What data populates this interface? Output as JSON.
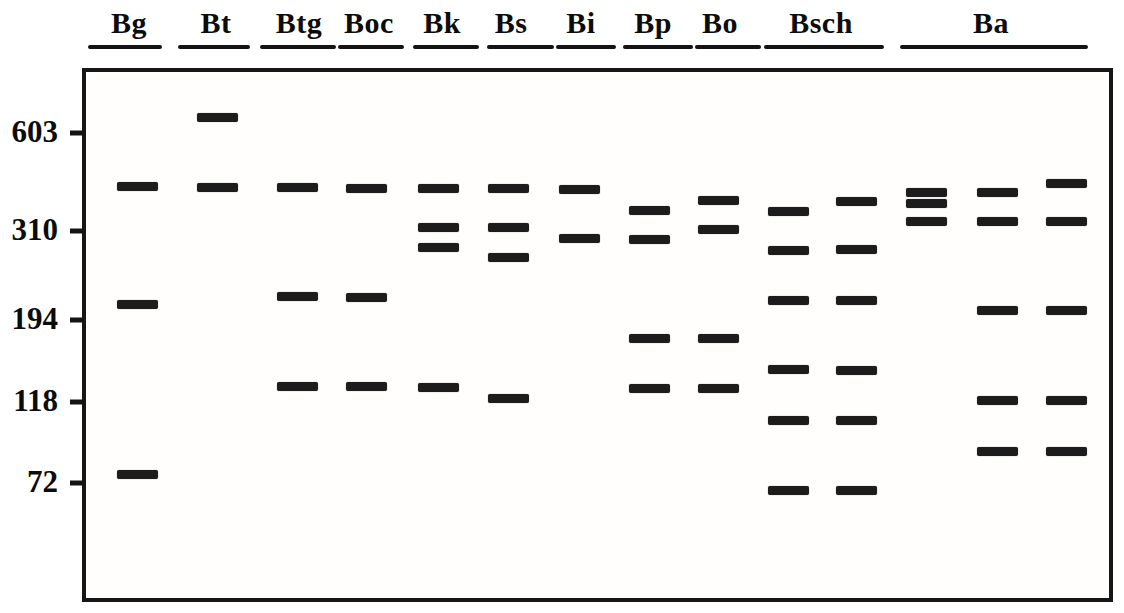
{
  "figure": {
    "kind": "gel-electrophoresis-schematic",
    "background_color": "#ffffff",
    "band_color": "#1c1c1c",
    "border_color": "#161616",
    "text_color": "#0c0c0c"
  },
  "gel": {
    "box": {
      "left": 82,
      "top": 68,
      "width": 1031,
      "height": 534
    },
    "band_size": {
      "width": 41,
      "height": 9
    },
    "markers": [
      {
        "label": "603",
        "y": 133
      },
      {
        "label": "310",
        "y": 231
      },
      {
        "label": "194",
        "y": 320
      },
      {
        "label": "118",
        "y": 402
      },
      {
        "label": "72",
        "y": 483
      }
    ],
    "lane_groups": [
      {
        "label": "Bg",
        "label_x": 129,
        "underline": [
          88,
          162
        ],
        "columns": [
          {
            "x": 137,
            "bands": [
              186,
              304,
              474
            ]
          }
        ]
      },
      {
        "label": "Bt",
        "label_x": 216,
        "underline": [
          178,
          250
        ],
        "columns": [
          {
            "x": 217,
            "bands": [
              117,
              187
            ]
          }
        ]
      },
      {
        "label": "Btg",
        "label_x": 299,
        "underline": [
          260,
          336
        ],
        "columns": [
          {
            "x": 297,
            "bands": [
              187,
              296,
              386
            ]
          }
        ]
      },
      {
        "label": "Boc",
        "label_x": 369,
        "underline": [
          338,
          404
        ],
        "columns": [
          {
            "x": 366,
            "bands": [
              188,
              297,
              386
            ]
          }
        ]
      },
      {
        "label": "Bk",
        "label_x": 442,
        "underline": [
          413,
          479
        ],
        "columns": [
          {
            "x": 438,
            "bands": [
              188,
              227,
              247,
              387
            ]
          }
        ]
      },
      {
        "label": "Bs",
        "label_x": 511,
        "underline": [
          487,
          554
        ],
        "columns": [
          {
            "x": 508,
            "bands": [
              188,
              227,
              257,
              398
            ]
          }
        ]
      },
      {
        "label": "Bi",
        "label_x": 581,
        "underline": [
          556,
          616
        ],
        "columns": [
          {
            "x": 579,
            "bands": [
              189,
              238
            ]
          }
        ]
      },
      {
        "label": "Bp",
        "label_x": 653,
        "underline": [
          623,
          693
        ],
        "columns": [
          {
            "x": 649,
            "bands": [
              210,
              239,
              338,
              388
            ]
          }
        ]
      },
      {
        "label": "Bo",
        "label_x": 720,
        "underline": [
          695,
          761
        ],
        "columns": [
          {
            "x": 718,
            "bands": [
              200,
              229,
              338,
              388
            ]
          }
        ]
      },
      {
        "label": "Bsch",
        "label_x": 821,
        "underline": [
          764,
          884
        ],
        "columns": [
          {
            "x": 788,
            "bands": [
              211,
              250,
              300,
              369,
              420,
              490
            ]
          },
          {
            "x": 856,
            "bands": [
              201,
              249,
              300,
              370,
              420,
              490
            ]
          }
        ]
      },
      {
        "label": "Ba",
        "label_x": 991,
        "underline": [
          900,
          1088
        ],
        "columns": [
          {
            "x": 926,
            "bands": [
              192,
              203,
              221
            ]
          },
          {
            "x": 997,
            "bands": [
              192,
              221,
              310,
              400,
              451
            ]
          },
          {
            "x": 1066,
            "bands": [
              183,
              221,
              310,
              400,
              451
            ]
          }
        ]
      }
    ]
  }
}
